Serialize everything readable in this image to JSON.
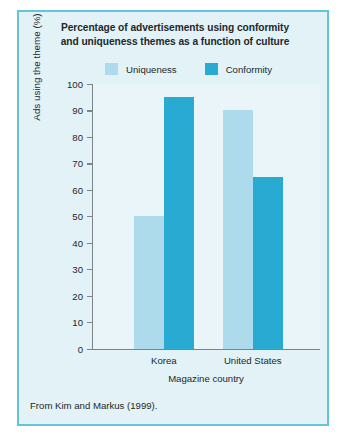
{
  "figure": {
    "panel_bg": "#e2f2f7",
    "panel_border": "#63c5d8",
    "plot_bg": "#eaf5f9",
    "axis_color": "#7b8588",
    "text_color": "#23282b",
    "source_note": "From Kim and Markus (1999)."
  },
  "chart_data": {
    "type": "bar",
    "title": "Percentage of advertisements using conformity and uniqueness themes as a function of culture",
    "title_lines": [
      "Percentage of advertisements using conformity",
      "and uniqueness themes as a function of culture"
    ],
    "xlabel": "Magazine country",
    "ylabel": "Ads using the theme (%)",
    "categories": [
      "Korea",
      "United States"
    ],
    "series": [
      {
        "name": "Uniqueness",
        "color": "#aedbec",
        "values": [
          50,
          90
        ]
      },
      {
        "name": "Conformity",
        "color": "#29aad2",
        "values": [
          95,
          65
        ]
      }
    ],
    "ylim": [
      0,
      100
    ],
    "yticks": [
      0,
      10,
      20,
      30,
      40,
      50,
      60,
      70,
      80,
      90,
      100
    ],
    "ytick_labels": [
      "0",
      "10",
      "20",
      "30",
      "40",
      "50",
      "60",
      "70",
      "80",
      "90",
      "100"
    ],
    "grid": false,
    "legend_position": "top-center",
    "legend_entries": [
      "Uniqueness",
      "Conformity"
    ]
  }
}
